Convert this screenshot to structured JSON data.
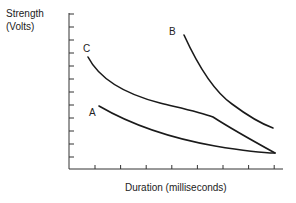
{
  "chart_data": {
    "type": "line",
    "title": "",
    "xlabel": "Duration (milliseconds)",
    "ylabel_line1": "Strength",
    "ylabel_line2": "(Volts)",
    "grid": false,
    "y_ticks": 12,
    "x_ticks": 8,
    "series": [
      {
        "name": "A",
        "points": [
          [
            0.12,
            0.4
          ],
          [
            0.3,
            0.3
          ],
          [
            0.5,
            0.22
          ],
          [
            0.7,
            0.16
          ],
          [
            0.85,
            0.13
          ],
          [
            1.0,
            0.11
          ]
        ]
      },
      {
        "name": "B",
        "points": [
          [
            0.54,
            0.86
          ],
          [
            0.62,
            0.7
          ],
          [
            0.72,
            0.55
          ],
          [
            0.85,
            0.42
          ],
          [
            0.95,
            0.3
          ]
        ]
      },
      {
        "name": "C",
        "points": [
          [
            0.08,
            0.72
          ],
          [
            0.2,
            0.57
          ],
          [
            0.4,
            0.46
          ],
          [
            0.6,
            0.39
          ],
          [
            0.68,
            0.34
          ],
          [
            1.0,
            0.11
          ]
        ]
      }
    ],
    "labels": {
      "A": "A",
      "B": "B",
      "C": "C"
    }
  }
}
